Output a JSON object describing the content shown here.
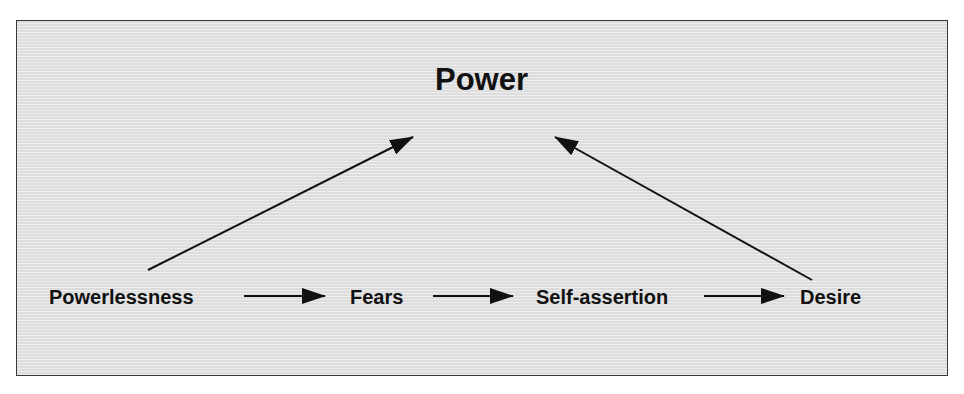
{
  "diagram": {
    "title": "Power",
    "nodes": [
      {
        "id": "powerlessness",
        "label": "Powerlessness"
      },
      {
        "id": "fears",
        "label": "Fears"
      },
      {
        "id": "self-assertion",
        "label": "Self-assertion"
      },
      {
        "id": "desire",
        "label": "Desire"
      }
    ],
    "edges": [
      {
        "from": "powerlessness",
        "to": "fears"
      },
      {
        "from": "fears",
        "to": "self-assertion"
      },
      {
        "from": "self-assertion",
        "to": "desire"
      },
      {
        "from": "powerlessness",
        "to": "power"
      },
      {
        "from": "desire",
        "to": "power"
      }
    ],
    "colors": {
      "background": "#e4e4e4",
      "border": "#3a3a3a",
      "text": "#111111",
      "arrow": "#111111"
    }
  }
}
